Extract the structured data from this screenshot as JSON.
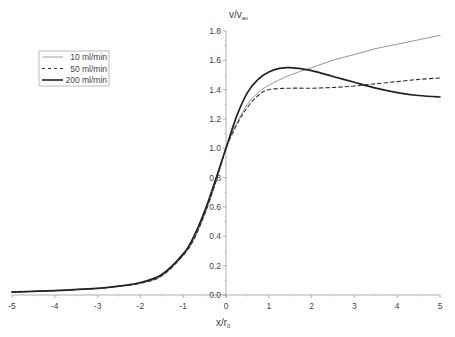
{
  "chart_data": {
    "type": "line",
    "title": "",
    "xlabel": "x/r",
    "xlabel_sub": "0",
    "ylabel": "v/v",
    "ylabel_sub": "av",
    "xlim": [
      -5,
      5
    ],
    "ylim": [
      0,
      1.8
    ],
    "xticks": [
      -5,
      -4,
      -3,
      -2,
      -1,
      0,
      1,
      2,
      3,
      4,
      5
    ],
    "yticks": [
      0.0,
      0.2,
      0.4,
      0.6,
      0.8,
      1.0,
      1.2,
      1.4,
      1.6,
      1.8
    ],
    "grid": false,
    "legend_position": "upper-left",
    "series": [
      {
        "name": "10 ml/min",
        "style": "thin",
        "x": [
          -5,
          -4,
          -3,
          -2.5,
          -2,
          -1.5,
          -1,
          -0.75,
          -0.5,
          -0.25,
          0,
          0.25,
          0.5,
          0.75,
          1,
          1.5,
          2,
          2.5,
          3,
          3.5,
          4,
          4.5,
          5
        ],
        "y": [
          0.02,
          0.03,
          0.045,
          0.06,
          0.08,
          0.13,
          0.27,
          0.38,
          0.55,
          0.76,
          1.0,
          1.17,
          1.3,
          1.38,
          1.43,
          1.5,
          1.55,
          1.6,
          1.64,
          1.68,
          1.71,
          1.74,
          1.77
        ]
      },
      {
        "name": "50 ml/min",
        "style": "dashed",
        "x": [
          -5,
          -4,
          -3,
          -2.5,
          -2,
          -1.5,
          -1,
          -0.75,
          -0.5,
          -0.25,
          0,
          0.25,
          0.5,
          0.75,
          1,
          1.5,
          2,
          2.5,
          3,
          3.5,
          4,
          4.5,
          5
        ],
        "y": [
          0.02,
          0.03,
          0.045,
          0.06,
          0.08,
          0.13,
          0.27,
          0.38,
          0.55,
          0.76,
          1.0,
          1.16,
          1.28,
          1.36,
          1.4,
          1.41,
          1.41,
          1.415,
          1.425,
          1.44,
          1.455,
          1.47,
          1.48
        ]
      },
      {
        "name": "200 ml/min",
        "style": "thick",
        "x": [
          -5,
          -4,
          -3,
          -2.5,
          -2,
          -1.5,
          -1,
          -0.75,
          -0.5,
          -0.25,
          0,
          0.25,
          0.5,
          0.75,
          1,
          1.25,
          1.5,
          2,
          2.5,
          3,
          3.5,
          4,
          4.5,
          5
        ],
        "y": [
          0.02,
          0.03,
          0.045,
          0.06,
          0.085,
          0.14,
          0.28,
          0.4,
          0.57,
          0.78,
          1.0,
          1.22,
          1.38,
          1.47,
          1.52,
          1.545,
          1.55,
          1.53,
          1.49,
          1.45,
          1.41,
          1.38,
          1.36,
          1.35
        ]
      }
    ]
  },
  "legend": {
    "items": [
      "10 ml/min",
      "50 ml/min",
      "200 ml/min"
    ]
  },
  "colors": {
    "thin": "#888888",
    "dashed": "#333333",
    "thick": "#222222",
    "axis": "#999999",
    "text": "#444444"
  }
}
